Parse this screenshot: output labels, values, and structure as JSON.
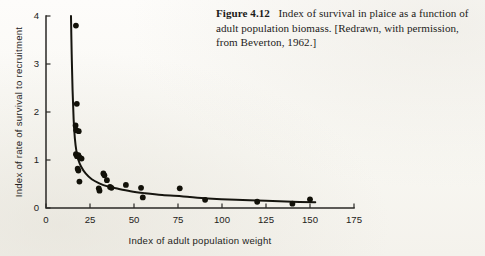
{
  "caption": {
    "figure_number": "Figure 4.12",
    "text": "Index of survival in plaice as a function of adult population biomass. [Redrawn, with permission, from Beverton, 1962.]"
  },
  "chart_data": {
    "type": "scatter",
    "title": "",
    "xlabel": "Index of adult population weight",
    "ylabel": "Index of rate of survival to recruitment",
    "xlim": [
      0,
      175
    ],
    "ylim": [
      0,
      4
    ],
    "xticks": [
      0,
      25,
      50,
      75,
      100,
      125,
      150,
      175
    ],
    "yticks": [
      0,
      1,
      2,
      3,
      4
    ],
    "grid": false,
    "legend": null,
    "series": [
      {
        "name": "observations",
        "marker": "filled-circle",
        "points": [
          [
            17.0,
            3.8
          ],
          [
            17.5,
            2.17
          ],
          [
            16.8,
            1.72
          ],
          [
            17.2,
            1.62
          ],
          [
            18.6,
            1.6
          ],
          [
            17.0,
            1.12
          ],
          [
            17.6,
            1.08
          ],
          [
            18.4,
            1.1
          ],
          [
            19.2,
            1.05
          ],
          [
            20.2,
            1.03
          ],
          [
            18.0,
            0.82
          ],
          [
            18.4,
            0.78
          ],
          [
            19.0,
            0.55
          ],
          [
            30.0,
            0.41
          ],
          [
            30.4,
            0.36
          ],
          [
            32.6,
            0.72
          ],
          [
            33.2,
            0.68
          ],
          [
            34.6,
            0.58
          ],
          [
            36.4,
            0.44
          ],
          [
            37.2,
            0.42
          ],
          [
            45.4,
            0.48
          ],
          [
            54.0,
            0.42
          ],
          [
            55.0,
            0.22
          ],
          [
            76.0,
            0.41
          ],
          [
            90.4,
            0.17
          ],
          [
            120.0,
            0.13
          ],
          [
            140.0,
            0.09
          ],
          [
            150.0,
            0.18
          ]
        ]
      },
      {
        "name": "fitted-curve",
        "type": "line",
        "description": "hyperbolic decline fitted to observations",
        "x_start": 14.2,
        "x_end": 153.0,
        "points": [
          [
            14.2,
            4.0
          ],
          [
            14.6,
            3.2
          ],
          [
            15.1,
            2.45
          ],
          [
            15.7,
            1.85
          ],
          [
            16.4,
            1.45
          ],
          [
            17.3,
            1.18
          ],
          [
            18.4,
            1.0
          ],
          [
            20.0,
            0.86
          ],
          [
            22.5,
            0.72
          ],
          [
            26.0,
            0.6
          ],
          [
            30.0,
            0.52
          ],
          [
            35.0,
            0.45
          ],
          [
            41.0,
            0.4
          ],
          [
            48.0,
            0.35
          ],
          [
            56.0,
            0.31
          ],
          [
            66.0,
            0.27
          ],
          [
            78.0,
            0.24
          ],
          [
            92.0,
            0.2
          ],
          [
            108.0,
            0.17
          ],
          [
            125.0,
            0.15
          ],
          [
            140.0,
            0.13
          ],
          [
            153.0,
            0.12
          ]
        ]
      }
    ]
  }
}
